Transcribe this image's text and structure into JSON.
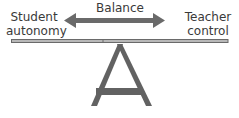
{
  "diagram": {
    "type": "seesaw-balance",
    "title": "Balance",
    "left_label": [
      "Student",
      "autonomy"
    ],
    "right_label": [
      "Teacher",
      "control"
    ],
    "arrow": "double-headed",
    "colors": {
      "arrow": "#6a6a6a",
      "beam_fill": "#b8b8b8",
      "beam_stroke": "#6a6a6a",
      "fulcrum": "#626262",
      "text": "#3a3a3a"
    }
  }
}
